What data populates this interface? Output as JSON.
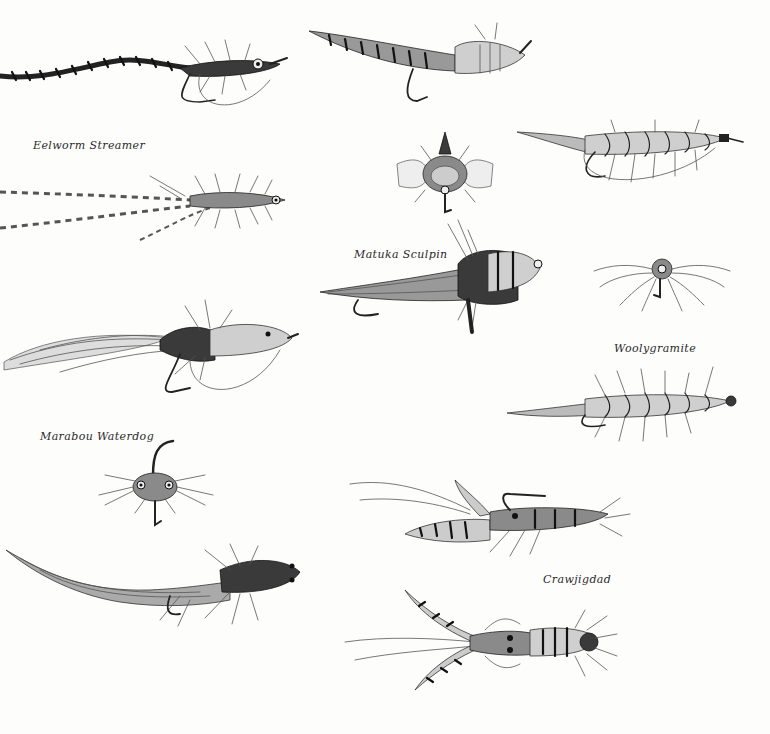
{
  "plate": {
    "captions": [
      {
        "id": "eelworm-streamer",
        "text": "Eelworm Streamer"
      },
      {
        "id": "matuka-sculpin",
        "text": "Matuka Sculpin"
      },
      {
        "id": "woolygramite",
        "text": "Woolygramite"
      },
      {
        "id": "marabou-waterdog",
        "text": "Marabou Waterdog"
      },
      {
        "id": "crawjigdad",
        "text": "Crawjigdad"
      }
    ]
  },
  "illustrations": [
    {
      "id": "eelworm-streamer-side",
      "label": "Eelworm Streamer (side view)"
    },
    {
      "id": "eelworm-streamer-top",
      "label": "Eelworm Streamer (top view)"
    },
    {
      "id": "matuka-sculpin-side",
      "label": "Matuka Sculpin (side view)"
    },
    {
      "id": "matuka-sculpin-front",
      "label": "Matuka Sculpin (front view)"
    },
    {
      "id": "matuka-sculpin-top",
      "label": "Matuka Sculpin (top view)"
    },
    {
      "id": "woolygramite-side",
      "label": "Woolygramite (side view)"
    },
    {
      "id": "woolygramite-front",
      "label": "Woolygramite (front view)"
    },
    {
      "id": "woolygramite-top",
      "label": "Woolygramite (top view)"
    },
    {
      "id": "marabou-waterdog-side",
      "label": "Marabou Waterdog (side view)"
    },
    {
      "id": "marabou-waterdog-front",
      "label": "Marabou Waterdog (front view)"
    },
    {
      "id": "marabou-waterdog-top",
      "label": "Marabou Waterdog (top view)"
    },
    {
      "id": "crawjigdad-side",
      "label": "Crawjigdad (side view)"
    },
    {
      "id": "crawjigdad-top",
      "label": "Crawjigdad (top view)"
    }
  ]
}
